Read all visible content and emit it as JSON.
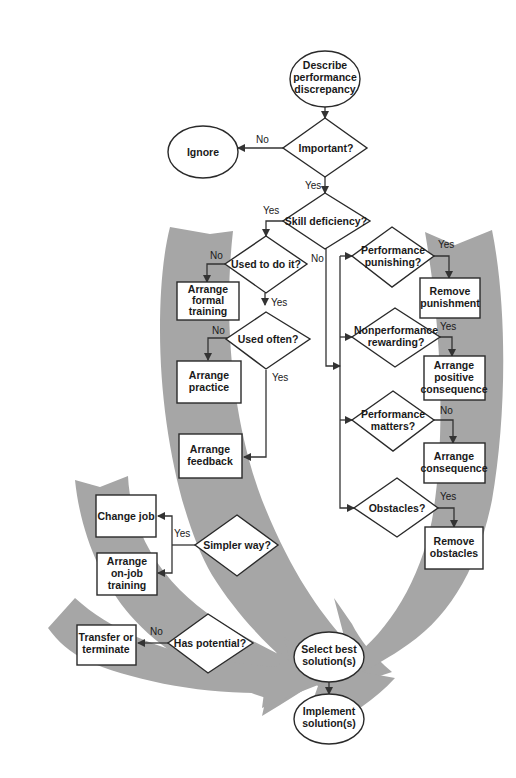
{
  "diagram": {
    "type": "flowchart",
    "colors": {
      "band": "#a6a6a6",
      "stroke": "#2a2a2a",
      "text": "#1a1a1a",
      "background": "#ffffff"
    },
    "nodes": {
      "start": {
        "shape": "ellipse",
        "lines": [
          "Describe",
          "performance",
          "discrepancy"
        ]
      },
      "important": {
        "shape": "diamond",
        "lines": [
          "Important?"
        ]
      },
      "ignore": {
        "shape": "ellipse",
        "lines": [
          "Ignore"
        ]
      },
      "skill": {
        "shape": "diamond",
        "lines": [
          "Skill deficiency?"
        ]
      },
      "used_to": {
        "shape": "diamond",
        "lines": [
          "Used to do it?"
        ]
      },
      "formal_training": {
        "shape": "box",
        "lines": [
          "Arrange",
          "formal",
          "training"
        ]
      },
      "used_often": {
        "shape": "diamond",
        "lines": [
          "Used often?"
        ]
      },
      "practice": {
        "shape": "box",
        "lines": [
          "Arrange",
          "practice"
        ]
      },
      "feedback": {
        "shape": "box",
        "lines": [
          "Arrange",
          "feedback"
        ]
      },
      "simpler": {
        "shape": "diamond",
        "lines": [
          "Simpler way?"
        ]
      },
      "change_job": {
        "shape": "box",
        "lines": [
          "Change job"
        ]
      },
      "onjob": {
        "shape": "box",
        "lines": [
          "Arrange",
          "on-job",
          "training"
        ]
      },
      "potential": {
        "shape": "diamond",
        "lines": [
          "Has potential?"
        ]
      },
      "transfer": {
        "shape": "box",
        "lines": [
          "Transfer or",
          "terminate"
        ]
      },
      "punishing": {
        "shape": "diamond",
        "lines": [
          "Performance",
          "punishing?"
        ]
      },
      "remove_punishment": {
        "shape": "box",
        "lines": [
          "Remove",
          "punishment"
        ]
      },
      "nonperf": {
        "shape": "diamond",
        "lines": [
          "Nonperformance",
          "rewarding?"
        ]
      },
      "positive": {
        "shape": "box",
        "lines": [
          "Arrange",
          "positive",
          "consequence"
        ]
      },
      "matters": {
        "shape": "diamond",
        "lines": [
          "Performance",
          "matters?"
        ]
      },
      "consequence": {
        "shape": "box",
        "lines": [
          "Arrange",
          "consequence"
        ]
      },
      "obstacles": {
        "shape": "diamond",
        "lines": [
          "Obstacles?"
        ]
      },
      "remove_obstacles": {
        "shape": "box",
        "lines": [
          "Remove",
          "obstacles"
        ]
      },
      "select": {
        "shape": "ellipse",
        "lines": [
          "Select best",
          "solution(s)"
        ]
      },
      "implement": {
        "shape": "ellipse",
        "lines": [
          "Implement",
          "solution(s)"
        ]
      }
    },
    "edge_labels": {
      "important_no": "No",
      "important_yes": "Yes",
      "skill_yes": "Yes",
      "skill_no": "No",
      "used_to_no": "No",
      "used_to_yes": "Yes",
      "used_often_no": "No",
      "used_often_yes": "Yes",
      "simpler_yes": "Yes",
      "potential_no": "No",
      "punishing_yes": "Yes",
      "nonperf_yes": "Yes",
      "matters_no": "No",
      "obstacles_yes": "Yes"
    }
  }
}
